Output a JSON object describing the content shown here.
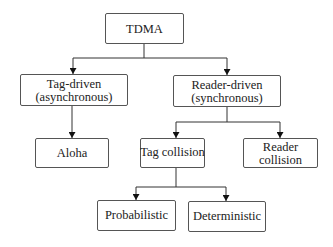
{
  "diagram": {
    "type": "hierarchy-tree",
    "colors": {
      "box_border": "#555555",
      "line": "#333333",
      "text": "#222222",
      "background": "#ffffff"
    },
    "nodes": {
      "tdma": {
        "line1": "TDMA"
      },
      "tag_driven": {
        "line1": "Tag-driven",
        "line2": "(asynchronous)"
      },
      "reader_driven": {
        "line1": "Reader-driven",
        "line2": "(synchronous)"
      },
      "aloha": {
        "line1": "Aloha"
      },
      "tag_collision": {
        "line1": "Tag collision"
      },
      "reader_collision": {
        "line1": "Reader",
        "line2": "collision"
      },
      "probabilistic": {
        "line1": "Probabilistic"
      },
      "deterministic": {
        "line1": "Deterministic"
      }
    },
    "edges": [
      {
        "from": "TDMA",
        "to": "Tag-driven (asynchronous)"
      },
      {
        "from": "TDMA",
        "to": "Reader-driven (synchronous)"
      },
      {
        "from": "Tag-driven (asynchronous)",
        "to": "Aloha"
      },
      {
        "from": "Reader-driven (synchronous)",
        "to": "Tag collision"
      },
      {
        "from": "Reader-driven (synchronous)",
        "to": "Reader collision"
      },
      {
        "from": "Tag collision",
        "to": "Probabilistic"
      },
      {
        "from": "Tag collision",
        "to": "Deterministic"
      }
    ]
  }
}
